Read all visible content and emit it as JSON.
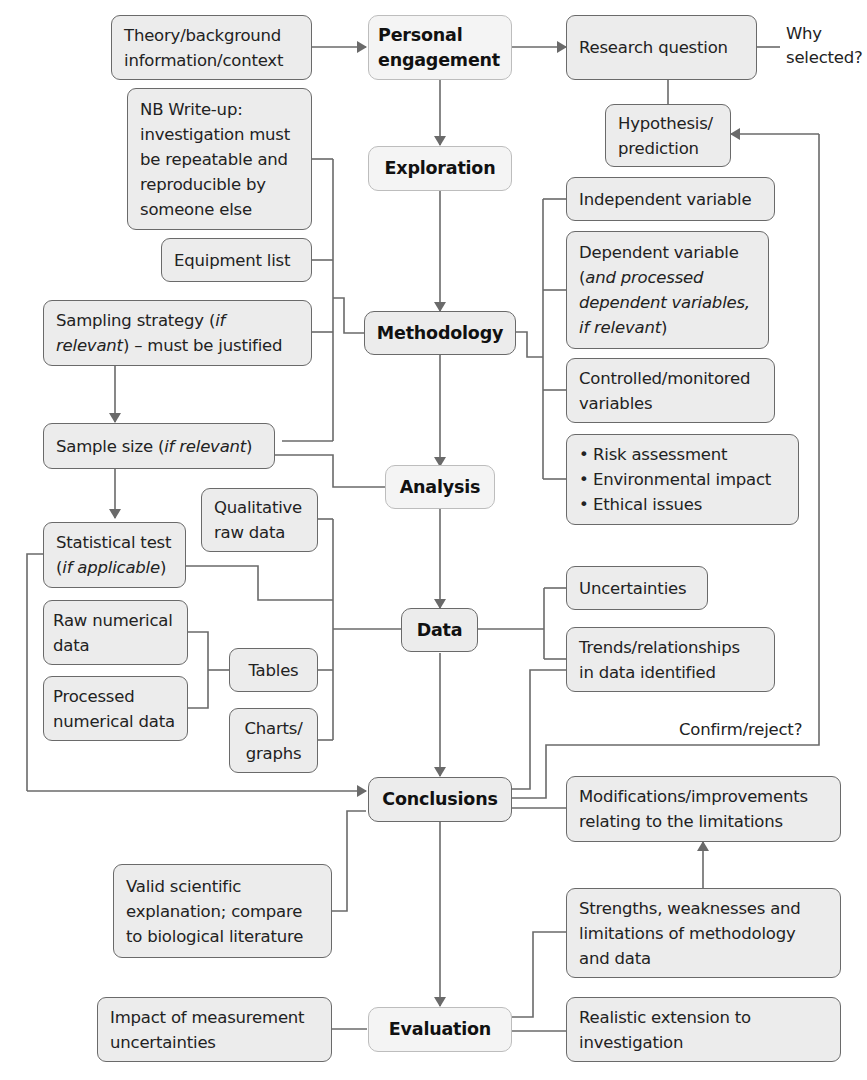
{
  "diagram": {
    "colors": {
      "box_fill": "#ececec",
      "stage_fill": "#f4f4f4",
      "line": "#6a6a6a",
      "text": "#222222"
    },
    "stages": {
      "personal_engagement": [
        "Personal",
        "engagement"
      ],
      "exploration": "Exploration",
      "methodology": "Methodology",
      "analysis": "Analysis",
      "data": "Data",
      "conclusions": "Conclusions",
      "evaluation": "Evaluation"
    },
    "left": {
      "theory": [
        "Theory/background",
        "information/context"
      ],
      "nb_writeup": [
        "NB Write-up:",
        "investigation must",
        "be repeatable and",
        "reproducible by",
        "someone else"
      ],
      "equipment": "Equipment list",
      "sampling": {
        "line1_pre": "Sampling strategy (",
        "line1_italic": "if",
        "line2_italic": "relevant",
        "line2_post": ") – must be justified"
      },
      "sample_size": {
        "pre": "Sample size (",
        "italic": "if relevant",
        "post": ")"
      },
      "statistical": {
        "line1": "Statistical test",
        "line2_pre": "(",
        "line2_italic": "if applicable",
        "line2_post": ")"
      },
      "qualitative": [
        "Qualitative",
        "raw data"
      ],
      "raw_numerical": [
        "Raw numerical",
        "data"
      ],
      "processed_numerical": [
        "Processed",
        "numerical data"
      ],
      "tables": "Tables",
      "charts": [
        "Charts/",
        "graphs"
      ],
      "valid_explanation": [
        "Valid scientific",
        "explanation; compare",
        "to biological literature"
      ],
      "impact_uncertainties": [
        "Impact of measurement",
        "uncertainties"
      ]
    },
    "right": {
      "research_question": "Research question",
      "why_selected": [
        "Why",
        "selected?"
      ],
      "hypothesis": [
        "Hypothesis/",
        "prediction"
      ],
      "independent": "Independent variable",
      "dependent": {
        "line1": "Dependent variable",
        "line2_pre": "(",
        "line2_italic": "and processed",
        "line3_italic": "dependent variables,",
        "line4_italic": "if relevant",
        "line4_post": ")"
      },
      "controlled": [
        "Controlled/monitored",
        "variables"
      ],
      "bullets": [
        "Risk assessment",
        "Environmental impact",
        "Ethical issues"
      ],
      "uncertainties": "Uncertainties",
      "trends": [
        "Trends/relationships",
        "in data identified"
      ],
      "confirm_reject": "Confirm/reject?",
      "modifications": [
        "Modifications/improvements",
        "relating to the limitations"
      ],
      "strengths": [
        "Strengths, weaknesses and",
        "limitations of methodology",
        "and data"
      ],
      "extension": [
        "Realistic extension to",
        "investigation"
      ]
    }
  }
}
